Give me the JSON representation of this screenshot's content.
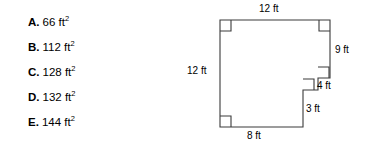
{
  "question": {
    "choices": [
      {
        "letter": "A.",
        "value": "66 ft",
        "exponent": "2"
      },
      {
        "letter": "B.",
        "value": "112 ft",
        "exponent": "2"
      },
      {
        "letter": "C.",
        "value": "128 ft",
        "exponent": "2"
      },
      {
        "letter": "D.",
        "value": "132 ft",
        "exponent": "2"
      },
      {
        "letter": "E.",
        "value": "144 ft",
        "exponent": "2"
      }
    ]
  },
  "figure": {
    "type": "polygon-diagram",
    "stroke_color": "#3a3a3a",
    "fill_color": "#ffffff",
    "labels": {
      "top": "12 ft",
      "right": "9 ft",
      "left": "12 ft",
      "bottom": "8 ft",
      "notch_horizontal": "4 ft",
      "notch_vertical": "3 ft"
    },
    "right_angle_markers": 4
  }
}
